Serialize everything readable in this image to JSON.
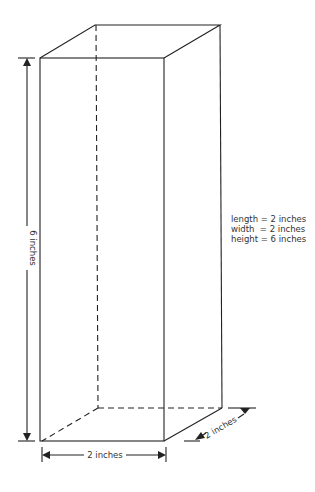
{
  "diagram": {
    "type": "rectangular-prism",
    "labels": {
      "height_dim": "6 inches",
      "length_dim": "2 inches",
      "width_dim": "2 inches"
    },
    "legend": [
      "length = 2 inches",
      "width  = 2 inches",
      "height = 6 inches"
    ],
    "colors": {
      "line": "#222222",
      "text": "#333333",
      "background": "#ffffff"
    }
  }
}
